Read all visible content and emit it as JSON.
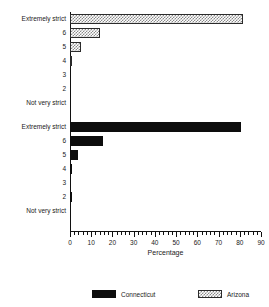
{
  "chart_data": {
    "type": "bar",
    "orientation": "horizontal",
    "title": "",
    "xlabel": "Percentage",
    "ylabel": "",
    "xlim": [
      0,
      90
    ],
    "xticks": [
      0,
      10,
      20,
      30,
      40,
      50,
      60,
      70,
      80,
      90
    ],
    "minor_tick_step": 2,
    "grid": false,
    "legend_position": "bottom",
    "categories": [
      "Extremely strict",
      "6",
      "5",
      "4",
      "3",
      "2",
      "Not very strict"
    ],
    "series": [
      {
        "name": "Arizona",
        "group_order": 1,
        "fill": "hatched",
        "values": [
          81.5,
          14.0,
          5.0,
          1.0,
          0.0,
          0.0,
          0.0
        ]
      },
      {
        "name": "Connecticut",
        "group_order": 2,
        "fill": "solid",
        "values": [
          80.5,
          15.5,
          3.7,
          1.0,
          0.0,
          0.7,
          0.0
        ]
      }
    ]
  },
  "axis": {
    "x_title": "Percentage"
  },
  "legend": {
    "items": [
      {
        "label": "Connecticut",
        "swatch": "solid-black"
      },
      {
        "label": "Arizona",
        "swatch": "hatched-gray"
      }
    ]
  },
  "colors": {
    "connecticut": "#0d0d0d",
    "arizona_outline": "#2b2b2b",
    "arizona_hatch": "#8a8a8a",
    "axis": "#101010",
    "text": "#1a1a1a",
    "background": "#ffffff"
  }
}
